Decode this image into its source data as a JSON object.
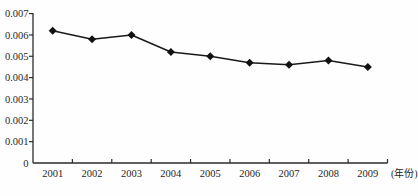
{
  "chart_data": {
    "type": "line",
    "title": "",
    "categories": [
      "2001",
      "2002",
      "2003",
      "2004",
      "2005",
      "2006",
      "2007",
      "2008",
      "2009"
    ],
    "values": [
      0.0062,
      0.0058,
      0.006,
      0.0052,
      0.005,
      0.0047,
      0.0046,
      0.0048,
      0.0045
    ],
    "xlabel": "(年份)",
    "ylabel": "",
    "ylim": [
      0,
      0.007
    ],
    "y_tick_step": 0.001,
    "y_tick_labels": [
      "0",
      "0.001",
      "0.002",
      "0.003",
      "0.004",
      "0.005",
      "0.006",
      "0.007"
    ],
    "grid": false,
    "legend": false,
    "marker": "diamond",
    "colors": {
      "line": "#1a1a1a",
      "marker": "#111111",
      "axis": "#2b2b2b",
      "text": "#1f1f1f",
      "background": "#fefefe"
    }
  }
}
